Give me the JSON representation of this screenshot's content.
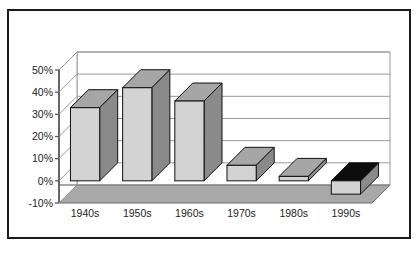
{
  "figure": {
    "background_color": "#ffffff",
    "frame_color": "#1a1a1a",
    "wall_color": "#ffffff",
    "gridline_color": "#9a9a9a",
    "axis_color": "#4d4d4d",
    "floor_color": "#a8a8a8",
    "floor_edge_color": "#6e6e6e",
    "bar_front_color": "#d3d3d3",
    "bar_side_color": "#8a8a8a",
    "bar_top_color": "#a6a6a6",
    "bar_negative_top_color": "#0d0d0d",
    "bar_outline_color": "#111111"
  },
  "chart_data": {
    "type": "bar",
    "title": "",
    "subtitle": "",
    "xlabel": "",
    "ylabel": "",
    "categories": [
      "1940s",
      "1950s",
      "1960s",
      "1970s",
      "1980s",
      "1990s"
    ],
    "values": [
      33,
      42,
      36,
      7,
      2,
      -6
    ],
    "series": [
      {
        "name": "",
        "values": [
          33,
          42,
          36,
          7,
          2,
          -6
        ]
      }
    ],
    "ylim": [
      -10,
      50
    ],
    "ytick_values": [
      50,
      40,
      30,
      20,
      10,
      0,
      -10
    ],
    "ytick_labels": [
      "50%",
      "40%",
      "30%",
      "20%",
      "10%",
      "0%",
      "-10%"
    ],
    "xtick_labels": [
      "1940s",
      "1950s",
      "1960s",
      "1970s",
      "1980s",
      "1990s"
    ],
    "grid": true,
    "grid_axis": "y",
    "legend": false,
    "legend_position": "none",
    "three_d": true,
    "annotations": []
  }
}
